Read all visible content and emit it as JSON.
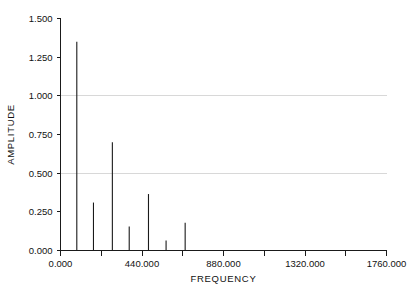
{
  "chart_data": {
    "type": "bar",
    "title": "",
    "xlabel": "FREQUENCY",
    "ylabel": "AMPLITUDE",
    "xlim": [
      0.0,
      1760.0
    ],
    "ylim": [
      0.0,
      1.5
    ],
    "grid": true,
    "legend": false,
    "x_major_ticks": [
      0.0,
      440.0,
      880.0,
      1320.0,
      1760.0
    ],
    "x_major_tick_labels": [
      "0.000",
      "440.000",
      "880.000",
      "1320.000",
      "1760.000"
    ],
    "x_minor_ticks": [
      220.0,
      660.0,
      1100.0,
      1540.0
    ],
    "y_ticks": [
      0.0,
      0.25,
      0.5,
      0.75,
      1.0,
      1.25,
      1.5
    ],
    "y_tick_labels": [
      "0.000",
      "0.250",
      "0.500",
      "0.750",
      "1.000",
      "1.250",
      "1.500"
    ],
    "gridline_values": [
      0.5,
      1.0
    ],
    "x": [
      88.0,
      178.0,
      280.0,
      371.0,
      475.0,
      570.0,
      673.0
    ],
    "values": [
      1.35,
      0.31,
      0.7,
      0.155,
      0.365,
      0.065,
      0.18
    ],
    "series": [
      {
        "name": "spectrum",
        "points": [
          {
            "frequency": 88.0,
            "amplitude": 1.35
          },
          {
            "frequency": 178.0,
            "amplitude": 0.31
          },
          {
            "frequency": 280.0,
            "amplitude": 0.7
          },
          {
            "frequency": 371.0,
            "amplitude": 0.155
          },
          {
            "frequency": 475.0,
            "amplitude": 0.365
          },
          {
            "frequency": 570.0,
            "amplitude": 0.065
          },
          {
            "frequency": 673.0,
            "amplitude": 0.18
          }
        ]
      }
    ],
    "colors": {
      "spike": "#1a1a1a",
      "axis": "#1a1a1a",
      "grid": "#d8d8d8",
      "background": "#ffffff",
      "text": "#111111"
    }
  }
}
